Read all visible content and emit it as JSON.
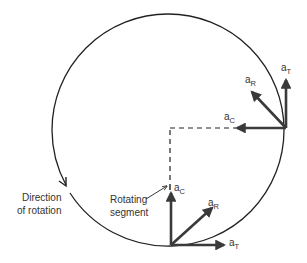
{
  "diagram": {
    "type": "circular-motion-acceleration-components",
    "colors": {
      "stroke": "#222222",
      "arrow": "#3a3a3a",
      "text": "#333333"
    },
    "labels": {
      "direction": [
        "Direction",
        "of rotation"
      ],
      "segment": [
        "Rotating",
        "segment"
      ]
    },
    "vectors": {
      "right_point": {
        "aT": {
          "base": "a",
          "sub": "T"
        },
        "aR": {
          "base": "a",
          "sub": "R"
        },
        "aC": {
          "base": "a",
          "sub": "C"
        }
      },
      "bottom_point": {
        "aT": {
          "base": "a",
          "sub": "T"
        },
        "aR": {
          "base": "a",
          "sub": "R"
        },
        "aC": {
          "base": "a",
          "sub": "C"
        }
      }
    }
  }
}
